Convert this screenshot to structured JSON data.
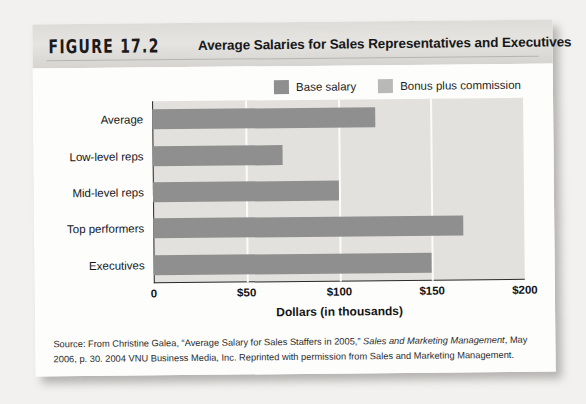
{
  "figure": {
    "number_label": "FIGURE 17.2",
    "title": "Average Salaries for Sales Representatives and Executives"
  },
  "ghost_text": {
    "line_a": "Motivating Salespeople",
    "line_b": "Motivating Salespeople"
  },
  "source": {
    "line1_prefix": "Source: From Christine Galea, “Average Salary for Sales Staffers in 2005,” ",
    "line1_italic": "Sales and Marketing Management",
    "line1_suffix": ", May 2006, p. 30.",
    "line2": "2004 VNU Business Media, Inc. Reprinted with permission from Sales and Marketing Management."
  },
  "colors": {
    "base_salary": "#8f8f8f",
    "bonus_plus_commission": "#b9b9b7",
    "plot_background": "#e2e1de",
    "gridline": "#fbfbfa",
    "axis": "#2b2b2b"
  },
  "chart_data": {
    "type": "bar",
    "orientation": "horizontal",
    "title": "Average Salaries for Sales Representatives and Executives",
    "xlabel": "Dollars (in thousands)",
    "ylabel": "",
    "xlim": [
      0,
      200
    ],
    "xticks": [
      0,
      50,
      100,
      150,
      200
    ],
    "xtick_labels": [
      "0",
      "$50",
      "$100",
      "$150",
      "$200"
    ],
    "gridlines": [
      50,
      100,
      150
    ],
    "grid": true,
    "legend_position": "top-right",
    "categories": [
      "Average",
      "Low-level reps",
      "Mid-level reps",
      "Top performers",
      "Executives"
    ],
    "series": [
      {
        "name": "Base salary",
        "color": "#8f8f8f",
        "values": [
          120,
          70,
          100,
          167,
          150
        ]
      },
      {
        "name": "Bonus plus commission",
        "color": "#b9b9b7",
        "values": [
          0,
          0,
          0,
          0,
          0
        ]
      }
    ],
    "units": "thousands of dollars"
  }
}
